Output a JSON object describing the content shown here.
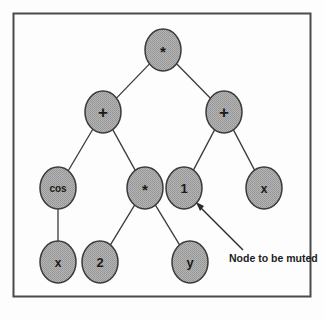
{
  "figure": {
    "border_color": "#4a4a4a",
    "background_color": "#fdfdfd",
    "node_fill_color": "#a9a9a9",
    "node_stroke_color": "#3a3a3a",
    "edge_color": "#3a3a3a",
    "label_color": "#1a1a1a"
  },
  "annotation": {
    "text": "Node to be muted",
    "arrow_name": "annotation-arrow"
  },
  "tree": {
    "nodes": [
      {
        "id": "n0",
        "label": "*",
        "icon": "asterisk-glyph",
        "cx": 163,
        "cy": 50,
        "rx": 18,
        "ry": 21,
        "font_size": 15,
        "level": 0
      },
      {
        "id": "n1",
        "label": "+",
        "icon": "plus-glyph",
        "cx": 103,
        "cy": 112,
        "rx": 18,
        "ry": 21,
        "font_size": 17,
        "level": 1
      },
      {
        "id": "n2",
        "label": "+",
        "icon": "plus-glyph",
        "cx": 224,
        "cy": 112,
        "rx": 18,
        "ry": 21,
        "font_size": 17,
        "level": 1
      },
      {
        "id": "n3",
        "label": "cos",
        "icon": "text-glyph",
        "cx": 58,
        "cy": 188,
        "rx": 18,
        "ry": 21,
        "font_size": 10,
        "level": 2
      },
      {
        "id": "n4",
        "label": "*",
        "icon": "asterisk-glyph",
        "cx": 145,
        "cy": 188,
        "rx": 18,
        "ry": 21,
        "font_size": 15,
        "level": 2
      },
      {
        "id": "n5",
        "label": "1",
        "icon": "text-glyph",
        "cx": 184,
        "cy": 188,
        "rx": 18,
        "ry": 21,
        "font_size": 13,
        "level": 2
      },
      {
        "id": "n6",
        "label": "x",
        "icon": "text-glyph",
        "cx": 264,
        "cy": 188,
        "rx": 18,
        "ry": 21,
        "font_size": 12,
        "level": 2
      },
      {
        "id": "n7",
        "label": "x",
        "icon": "text-glyph",
        "cx": 58,
        "cy": 262,
        "rx": 18,
        "ry": 21,
        "font_size": 12,
        "level": 3
      },
      {
        "id": "n8",
        "label": "2",
        "icon": "text-glyph",
        "cx": 100,
        "cy": 262,
        "rx": 18,
        "ry": 21,
        "font_size": 13,
        "level": 3
      },
      {
        "id": "n9",
        "label": "y",
        "icon": "text-glyph",
        "cx": 190,
        "cy": 262,
        "rx": 18,
        "ry": 21,
        "font_size": 13,
        "level": 3
      }
    ],
    "edges": [
      {
        "from": "n0",
        "to": "n1"
      },
      {
        "from": "n0",
        "to": "n2"
      },
      {
        "from": "n1",
        "to": "n3"
      },
      {
        "from": "n1",
        "to": "n4"
      },
      {
        "from": "n2",
        "to": "n5"
      },
      {
        "from": "n2",
        "to": "n6"
      },
      {
        "from": "n3",
        "to": "n7"
      },
      {
        "from": "n4",
        "to": "n8"
      },
      {
        "from": "n4",
        "to": "n9"
      }
    ],
    "muted_node_id": "n5"
  }
}
